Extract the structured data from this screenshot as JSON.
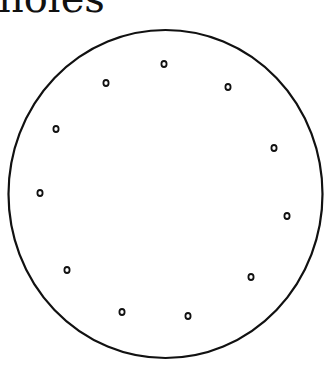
{
  "title": "holes",
  "disk": {
    "cx": 165.5,
    "cy": 194,
    "rx": 157,
    "ry": 164,
    "stroke": "#111111"
  },
  "holes": [
    {
      "x": 164,
      "y": 64
    },
    {
      "x": 106,
      "y": 83
    },
    {
      "x": 228,
      "y": 87
    },
    {
      "x": 56,
      "y": 129
    },
    {
      "x": 274,
      "y": 148
    },
    {
      "x": 40,
      "y": 193
    },
    {
      "x": 287,
      "y": 216
    },
    {
      "x": 67,
      "y": 270
    },
    {
      "x": 251,
      "y": 277
    },
    {
      "x": 122,
      "y": 312
    },
    {
      "x": 188,
      "y": 316
    }
  ]
}
